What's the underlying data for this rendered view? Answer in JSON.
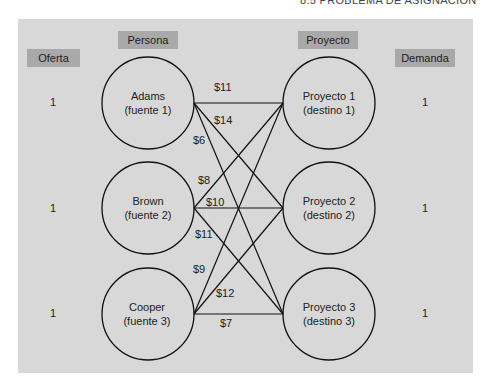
{
  "page_header": "8.5   PROBLEMA DE ASIGNACIÓN",
  "headers": {
    "supply": "Oferta",
    "person": "Persona",
    "project": "Proyecto",
    "demand": "Demanda"
  },
  "sources": [
    {
      "name": "Adams",
      "role": "(fuente 1)",
      "supply": "1"
    },
    {
      "name": "Brown",
      "role": "(fuente 2)",
      "supply": "1"
    },
    {
      "name": "Cooper",
      "role": "(fuente 3)",
      "supply": "1"
    }
  ],
  "destinations": [
    {
      "name": "Proyecto 1",
      "role": "(destino 1)",
      "demand": "1"
    },
    {
      "name": "Proyecto 2",
      "role": "(destino 2)",
      "demand": "1"
    },
    {
      "name": "Proyecto 3",
      "role": "(destino 3)",
      "demand": "1"
    }
  ],
  "arcs": [
    {
      "from": "Adams",
      "to": "Proyecto 1",
      "cost": "$11"
    },
    {
      "from": "Adams",
      "to": "Proyecto 2",
      "cost": "$14"
    },
    {
      "from": "Adams",
      "to": "Proyecto 3",
      "cost": "$6"
    },
    {
      "from": "Brown",
      "to": "Proyecto 1",
      "cost": "$8"
    },
    {
      "from": "Brown",
      "to": "Proyecto 2",
      "cost": "$10"
    },
    {
      "from": "Brown",
      "to": "Proyecto 3",
      "cost": "$11"
    },
    {
      "from": "Cooper",
      "to": "Proyecto 1",
      "cost": "$9"
    },
    {
      "from": "Cooper",
      "to": "Proyecto 2",
      "cost": "$12"
    },
    {
      "from": "Cooper",
      "to": "Proyecto 3",
      "cost": "$7"
    }
  ],
  "colors": {
    "panel": "#d8d8d8",
    "tag": "#a9a9a9",
    "stroke": "#111111"
  }
}
